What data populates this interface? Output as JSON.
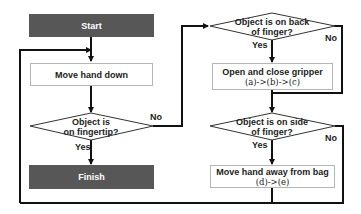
{
  "nodes": {
    "start": {
      "label": "Start",
      "fill": "#575757"
    },
    "move_down": {
      "label": "Move hand down"
    },
    "on_fingertip": {
      "line1": "Object is",
      "line2": "on fingertip?"
    },
    "finish": {
      "label": "Finish",
      "fill": "#575757"
    },
    "on_back": {
      "line1": "Object is on back",
      "line2": "of finger?"
    },
    "gripper": {
      "line1": "Open and close gripper",
      "line2": "(a)->(b)->(c)"
    },
    "on_side": {
      "line1": "Object is on side",
      "line2": "of finger?"
    },
    "move_away": {
      "line1": "Move hand away from bag",
      "line2": "(d)->(e)"
    }
  },
  "edge_labels": {
    "fingertip_no": "No",
    "fingertip_yes": "Yes",
    "back_yes": "Yes",
    "back_no": "No",
    "side_yes": "Yes",
    "side_no": "No"
  }
}
